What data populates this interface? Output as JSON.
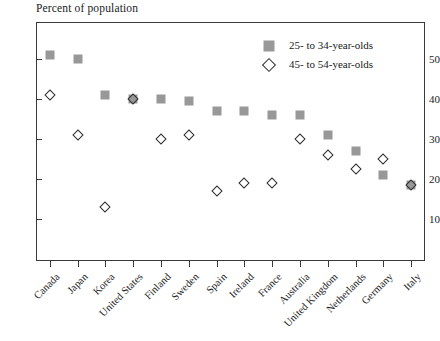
{
  "chart_data": {
    "type": "scatter",
    "title": "",
    "ylabel": "Percent of population",
    "xlabel": "",
    "ylim": [
      0,
      57
    ],
    "yticks": [
      10,
      20,
      30,
      40,
      50
    ],
    "grid": false,
    "legend_position": "top-right",
    "categories": [
      "Canada",
      "Japan",
      "Korea",
      "United States",
      "Finland",
      "Sweden",
      "Spain",
      "Ireland",
      "France",
      "Australia",
      "United Kingdom",
      "Netherlands",
      "Germany",
      "Italy"
    ],
    "series": [
      {
        "name": "25- to 34-year-olds",
        "marker": "square",
        "color": "#989898",
        "values": [
          51,
          50,
          41,
          40,
          40,
          39.5,
          37,
          37,
          36,
          36,
          31,
          27,
          21,
          18.5
        ]
      },
      {
        "name": "45- to 54-year-olds",
        "marker": "diamond",
        "color": "#2b2b2b",
        "values": [
          41,
          31,
          13,
          40,
          30,
          31,
          17,
          19,
          19,
          30,
          26,
          22.5,
          25,
          18.5
        ]
      }
    ]
  },
  "legend": {
    "items": [
      {
        "label": "25- to 34-year-olds",
        "marker": "square"
      },
      {
        "label": "45- to 54-year-olds",
        "marker": "diamond"
      }
    ]
  }
}
